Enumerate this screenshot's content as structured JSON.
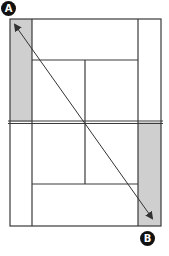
{
  "diagram": {
    "type": "tennis-court-top-view",
    "labels": {
      "start": "A",
      "end": "B"
    },
    "colors": {
      "line": "#3a3a3a",
      "alley_fill": "#cfcfcf",
      "court_fill": "#ffffff",
      "arrow": "#333333",
      "badge": "#111111"
    },
    "shaded_areas": [
      "top-left doubles alley",
      "bottom-right doubles alley"
    ],
    "arrow": {
      "from": "A",
      "to": "B",
      "description": "diagonal from top-left corner to bottom-right corner"
    }
  }
}
